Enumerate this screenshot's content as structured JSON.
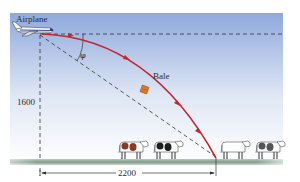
{
  "diagram": {
    "labels": {
      "airplane": "Airplane",
      "bale": "Bale",
      "angle": "φ",
      "height": "1600",
      "distance": "2200"
    },
    "colors": {
      "sky_top": "#8fa9dc",
      "sky_bottom": "#ffffff",
      "trajectory": "#c4262e",
      "bale": "#d9772c",
      "ground": "#7f9a8a",
      "dashed": "#333333"
    },
    "cows": [
      {
        "pattern": "brown-white"
      },
      {
        "pattern": "black-white"
      },
      {
        "pattern": "white"
      },
      {
        "pattern": "gray-white"
      }
    ]
  }
}
